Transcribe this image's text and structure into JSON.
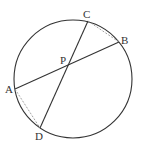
{
  "diagram": {
    "type": "circle-intersecting-chords",
    "circle": {
      "cx": 73,
      "cy": 79,
      "r": 59
    },
    "points": [
      {
        "id": "A",
        "label": "A",
        "x": 15,
        "y": 89,
        "lx": 5,
        "ly": 93
      },
      {
        "id": "B",
        "label": "B",
        "x": 119,
        "y": 42,
        "lx": 121,
        "ly": 44
      },
      {
        "id": "C",
        "label": "C",
        "x": 88,
        "y": 21,
        "lx": 83,
        "ly": 18
      },
      {
        "id": "D",
        "label": "D",
        "x": 40,
        "y": 128,
        "lx": 35,
        "ly": 140
      },
      {
        "id": "P",
        "label": "P",
        "x": 67,
        "y": 66,
        "lx": 60,
        "ly": 64
      }
    ],
    "chords": [
      {
        "from": "A",
        "to": "B",
        "style": "solid"
      },
      {
        "from": "C",
        "to": "D",
        "style": "solid"
      }
    ],
    "dashed_segments": [
      {
        "from": "C",
        "to": "B",
        "style": "dashed"
      },
      {
        "from": "A",
        "to": "D",
        "style": "dashed"
      }
    ],
    "colors": {
      "stroke": "#333333",
      "dashed": "#999999",
      "background": "#ffffff"
    }
  }
}
